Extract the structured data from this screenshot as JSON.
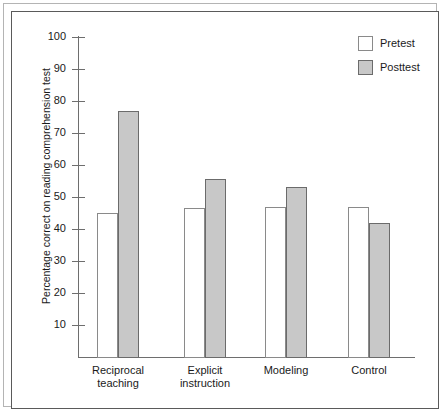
{
  "chart_data": {
    "type": "bar",
    "title": "",
    "subtitle": "",
    "xlabel": "",
    "ylabel": "Percentage correct on reading comprehension test",
    "categories": [
      "Reciprocal teaching",
      "Explicit instruction",
      "Modeling",
      "Control"
    ],
    "category_lines": [
      [
        "Reciprocal",
        "teaching"
      ],
      [
        "Explicit",
        "instruction"
      ],
      [
        "Modeling",
        ""
      ],
      [
        "Control",
        ""
      ]
    ],
    "series": [
      {
        "name": "Pretest",
        "values": [
          45,
          46.5,
          47,
          47
        ],
        "color": "#ffffff"
      },
      {
        "name": "Posttest",
        "values": [
          77,
          55.5,
          53,
          42
        ],
        "color": "#c8c8c8"
      }
    ],
    "ylim": [
      0,
      100
    ],
    "ytick_labels": [
      "100",
      "90",
      "80",
      "70",
      "60",
      "50",
      "40",
      "30",
      "20",
      "10"
    ],
    "ytick_values": [
      100,
      90,
      80,
      70,
      60,
      50,
      40,
      30,
      20,
      10
    ],
    "grid": false,
    "legend_position": "top-right"
  },
  "legend": {
    "entries": [
      {
        "label": "Pretest"
      },
      {
        "label": "Posttest"
      }
    ]
  },
  "axis": {
    "y_title": "Percentage correct on reading comprehension test"
  },
  "colors": {
    "pretest_fill": "#ffffff",
    "posttest_fill": "#c8c8c8",
    "bar_outline": "#6b6b6b",
    "axis_line": "#6e6e6e",
    "frame_outer": "#b4b4b4",
    "frame_inner": "#5a5a5a",
    "text": "#1a1a1a"
  }
}
